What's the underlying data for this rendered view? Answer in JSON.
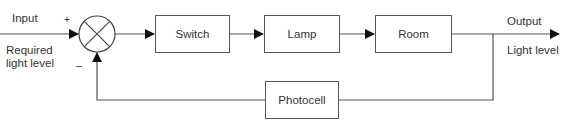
{
  "diagram": {
    "type": "closed-loop control block diagram",
    "input": {
      "label": "Input",
      "sublabel_line1": "Required",
      "sublabel_line2": "light level"
    },
    "summing_junction": {
      "plus_sign": "+",
      "minus_sign": "–"
    },
    "blocks": [
      {
        "id": "switch",
        "label": "Switch"
      },
      {
        "id": "lamp",
        "label": "Lamp"
      },
      {
        "id": "room",
        "label": "Room"
      }
    ],
    "feedback": {
      "label": "Photocell"
    },
    "output": {
      "label": "Output",
      "sublabel": "Light level"
    },
    "colors": {
      "line": "#555555",
      "text": "#333333",
      "background": "#ffffff"
    }
  }
}
